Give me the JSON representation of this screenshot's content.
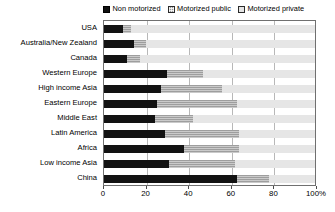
{
  "chart_data": {
    "type": "bar",
    "orientation": "horizontal",
    "stacked": true,
    "stacked_percent": true,
    "title": "",
    "subtitle": "",
    "xlabel": "",
    "ylabel": "",
    "xlim": [
      0,
      100
    ],
    "xticks": [
      0,
      20,
      40,
      60,
      80,
      100
    ],
    "xtick_labels": [
      "0",
      "20",
      "40",
      "60",
      "80",
      "100%"
    ],
    "grid": true,
    "grid_axis": "x",
    "legend_position": "top-right",
    "categories": [
      "USA",
      "Australia/New Zealand",
      "Canada",
      "Western Europe",
      "High income Asia",
      "Eastern Europe",
      "Middle East",
      "Latin America",
      "Africa",
      "Low income Asia",
      "China"
    ],
    "series": [
      {
        "name": "Non motorized",
        "color": "#121212",
        "values": [
          9,
          14,
          11,
          30,
          27,
          25,
          24,
          29,
          38,
          31,
          63
        ]
      },
      {
        "name": "Motorized public",
        "color": "#9e9e9e",
        "values": [
          4,
          6,
          6,
          17,
          29,
          38,
          18,
          35,
          26,
          31,
          15
        ]
      },
      {
        "name": "Motorized private",
        "color": "#e6e6e6",
        "values": [
          87,
          80,
          83,
          53,
          44,
          37,
          58,
          36,
          36,
          38,
          22
        ]
      }
    ],
    "legend": [
      {
        "label": "Non motorized",
        "swatch": "legend-swatch-non-motorized"
      },
      {
        "label": "Motorized public",
        "swatch": "legend-swatch-motorized-public"
      },
      {
        "label": "Motorized private",
        "swatch": "legend-swatch-motorized-private"
      }
    ],
    "colors": {
      "non_motorized": "#121212",
      "motorized_public": "#9e9e9e",
      "motorized_private": "#e6e6e6",
      "gridline": "#b8b8b8",
      "frame": "#707070",
      "text": "#000000",
      "background": "#ffffff"
    }
  }
}
